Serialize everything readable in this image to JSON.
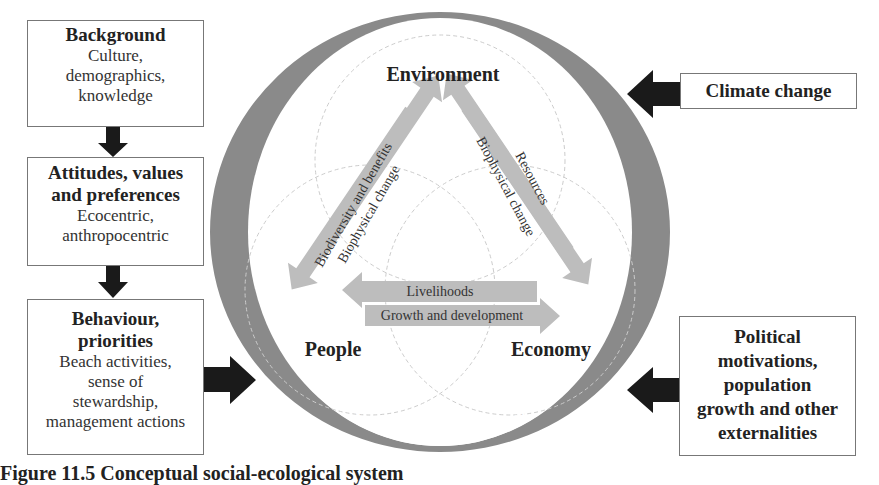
{
  "left_column": {
    "background": {
      "title": "Background",
      "lines": [
        "Culture,",
        "demographics,",
        "knowledge"
      ]
    },
    "attitudes": {
      "title_lines": [
        "Attitudes, values",
        "and preferences"
      ],
      "lines": [
        "Ecocentric,",
        "anthropocentric"
      ]
    },
    "behaviour": {
      "title_lines": [
        "Behaviour,",
        "priorities"
      ],
      "lines": [
        "Beach activities,",
        "sense of",
        "stewardship,",
        "management actions"
      ]
    }
  },
  "right_column": {
    "climate": {
      "title": "Climate change"
    },
    "political": {
      "title_lines": [
        "Political",
        "motivations,",
        "population",
        "growth and other",
        "externalities"
      ]
    }
  },
  "center": {
    "nodes": {
      "environment": "Environment",
      "people": "People",
      "economy": "Economy"
    },
    "arrows": {
      "left_outer": "Biodiversity and benefits",
      "left_inner": "Biophysical change",
      "right_outer": "Resources",
      "right_inner": "Biophysical change",
      "bottom_top": "Livelihoods",
      "bottom_bottom": "Growth and development"
    },
    "ring_label": "Social-Ecological System"
  },
  "caption": "Figure 11.5   Conceptual social-ecological system",
  "colors": {
    "ring": "#8a8a8a",
    "arrow_fill": "#bdbdbd",
    "black_arrow": "#1a1a1a",
    "border": "#777777"
  }
}
